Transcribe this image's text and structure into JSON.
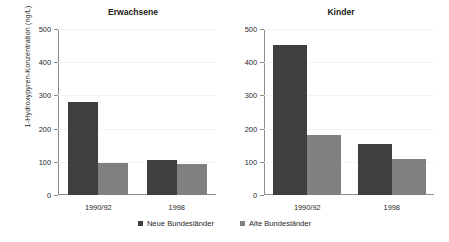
{
  "chart_data": {
    "type": "bar",
    "title": "",
    "xlabel": "",
    "ylabel": "1-Hydroxypyren-Konzentration (ng/L)",
    "ylim": [
      0,
      500
    ],
    "yticks": [
      0,
      100,
      200,
      300,
      400,
      500
    ],
    "grid": true,
    "legend_position": "bottom",
    "categories": [
      "1990/92",
      "1998"
    ],
    "legend": [
      "Neue Bundesländer",
      "Alte Bundesländer"
    ],
    "colors": {
      "neue": "#3f3f3f",
      "alte": "#808080",
      "axis": "#8c8c8c",
      "grid": "#f2f2f2",
      "background": "#ffffff",
      "text": "#262626"
    },
    "panels": [
      {
        "title": "Erwachsene",
        "categories": [
          "1990/92",
          "1998"
        ],
        "series": [
          {
            "name": "Neue Bundesländer",
            "values": [
              281,
              106
            ]
          },
          {
            "name": "Alte Bundesländer",
            "values": [
              95,
              92
            ]
          }
        ]
      },
      {
        "title": "Kinder",
        "categories": [
          "1990/92",
          "1998"
        ],
        "series": [
          {
            "name": "Neue Bundesländer",
            "values": [
              451,
              153
            ]
          },
          {
            "name": "Alte Bundesländer",
            "values": [
              181,
              108
            ]
          }
        ]
      }
    ]
  },
  "axis": {
    "ytick_labels": [
      "500",
      "400",
      "300",
      "200",
      "100",
      "0"
    ]
  },
  "panels": {
    "left": {
      "title": "Erwachsene",
      "xtick_labels": [
        "1990/92",
        "1998"
      ]
    },
    "right": {
      "title": "Kinder",
      "xtick_labels": [
        "1990/92",
        "1998"
      ]
    }
  },
  "ylabel": "1-Hydroxypyren-Konzentration (ng/L)",
  "legend": {
    "items": [
      {
        "label": "Neue Bundesländer"
      },
      {
        "label": "Alte Bundesländer"
      }
    ]
  }
}
